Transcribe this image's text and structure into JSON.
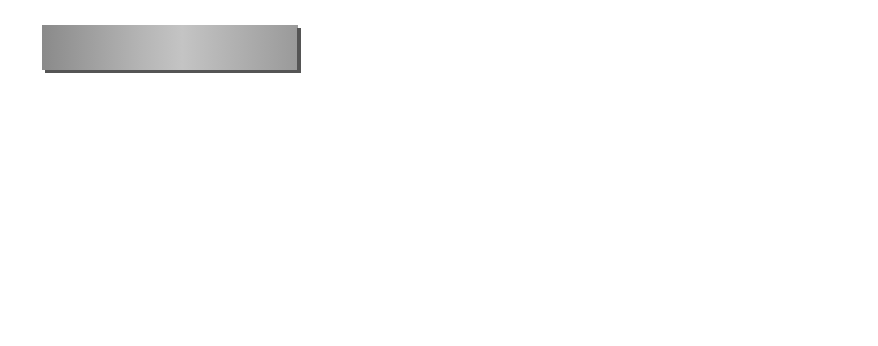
{
  "diagram": {
    "interface_layer": {
      "label": "Interface layer"
    },
    "function_layer": {
      "label": "Function layer",
      "verifying_module": {
        "label": "Verifying module"
      },
      "modeling_module": {
        "label": "Modeling module",
        "submodules": [
          {
            "label": "Data processing module"
          },
          {
            "label": "Graphic operation module"
          }
        ]
      }
    },
    "data_layer": {
      "label_line1": "Data",
      "label_line2": "layer"
    },
    "connections": [
      {
        "from": "function_layer",
        "to": "interface_layer",
        "style": "block-arrow-up"
      },
      {
        "from": "modeling_module",
        "to": "verifying_module",
        "style": "thin-arrow-up"
      },
      {
        "from": "data_layer",
        "to": "interface_layer",
        "style": "block-arrow-left"
      },
      {
        "from": "data_layer",
        "to": "function_layer",
        "style": "block-arrow-left"
      }
    ],
    "colors": {
      "layer_fill": "#a8a8a8",
      "layer_shadow": "#555555",
      "module_fill": "#eeeeee",
      "arrow_fill": "#b0b0b0"
    }
  }
}
